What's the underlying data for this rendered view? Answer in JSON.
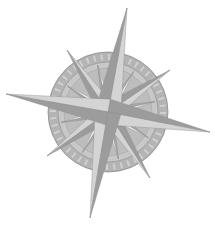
{
  "image": {
    "subject": "compass-rose",
    "width": 215,
    "height": 225,
    "background": "#ffffff"
  },
  "compass": {
    "center": [
      108,
      112
    ],
    "ring_outer_radius": 60,
    "ring_inner_radius": 50,
    "inner_disc_radius": 44,
    "rotation_deg": 10,
    "colors": {
      "ring": "#b4b4b4",
      "ring_tick": "#d2d2d2",
      "disc": "#c8c8c8",
      "point_light": "#d4d4d4",
      "point_dark": "#9c9c9c",
      "accent_light": "#ececec",
      "accent_dark": "#a8a8a8",
      "outline": "#8c8c8c"
    },
    "main_points": [
      {
        "name": "N",
        "tip": [
          127,
          8
        ]
      },
      {
        "name": "E",
        "tip": [
          210,
          132
        ]
      },
      {
        "name": "S",
        "tip": [
          90,
          218
        ]
      },
      {
        "name": "W",
        "tip": [
          6,
          94
        ]
      }
    ],
    "intercardinal_points": [
      {
        "name": "NE",
        "tip": [
          170,
          70
        ]
      },
      {
        "name": "SE",
        "tip": [
          150,
          178
        ]
      },
      {
        "name": "SW",
        "tip": [
          47,
          156
        ]
      },
      {
        "name": "NW",
        "tip": [
          67,
          50
        ]
      }
    ]
  }
}
